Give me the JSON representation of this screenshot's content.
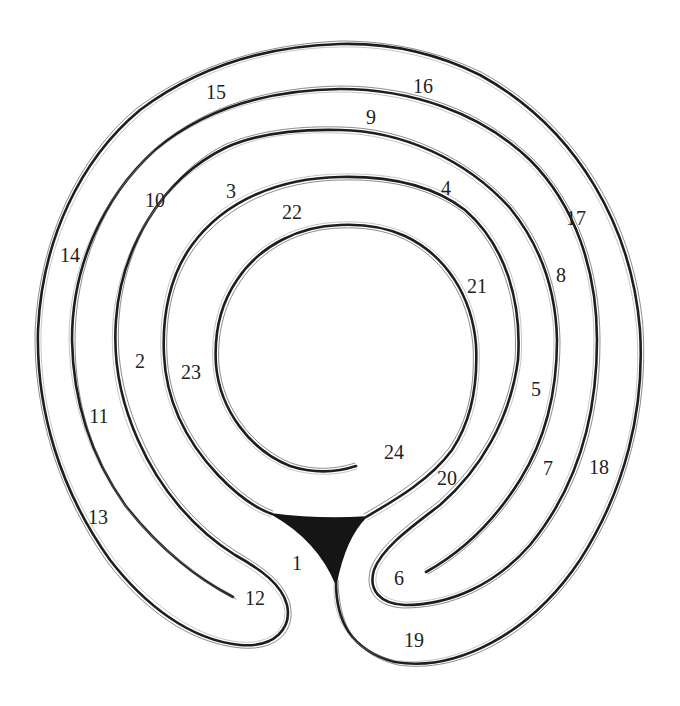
{
  "diagram": {
    "type": "labyrinth",
    "colors": {
      "background": "#ffffff",
      "line": "#1e1e1e",
      "entry_fill": "#151515"
    },
    "entry_marker": "filled-triangle",
    "labels": [
      {
        "id": "1",
        "text": "1",
        "x": 297,
        "y": 563
      },
      {
        "id": "2",
        "text": "2",
        "x": 140,
        "y": 361
      },
      {
        "id": "3",
        "text": "3",
        "x": 231,
        "y": 191
      },
      {
        "id": "4",
        "text": "4",
        "x": 446,
        "y": 188
      },
      {
        "id": "5",
        "text": "5",
        "x": 536,
        "y": 389
      },
      {
        "id": "6",
        "text": "6",
        "x": 399,
        "y": 578
      },
      {
        "id": "7",
        "text": "7",
        "x": 548,
        "y": 468
      },
      {
        "id": "8",
        "text": "8",
        "x": 561,
        "y": 275
      },
      {
        "id": "9",
        "text": "9",
        "x": 371,
        "y": 117
      },
      {
        "id": "10",
        "text": "10",
        "x": 155,
        "y": 200
      },
      {
        "id": "11",
        "text": "11",
        "x": 99,
        "y": 416
      },
      {
        "id": "12",
        "text": "12",
        "x": 255,
        "y": 598
      },
      {
        "id": "13",
        "text": "13",
        "x": 98,
        "y": 517
      },
      {
        "id": "14",
        "text": "14",
        "x": 70,
        "y": 255
      },
      {
        "id": "15",
        "text": "15",
        "x": 216,
        "y": 92
      },
      {
        "id": "16",
        "text": "16",
        "x": 423,
        "y": 86
      },
      {
        "id": "17",
        "text": "17",
        "x": 576,
        "y": 218
      },
      {
        "id": "18",
        "text": "18",
        "x": 599,
        "y": 467
      },
      {
        "id": "19",
        "text": "19",
        "x": 414,
        "y": 640
      },
      {
        "id": "20",
        "text": "20",
        "x": 447,
        "y": 478
      },
      {
        "id": "21",
        "text": "21",
        "x": 477,
        "y": 286
      },
      {
        "id": "22",
        "text": "22",
        "x": 292,
        "y": 212
      },
      {
        "id": "23",
        "text": "23",
        "x": 191,
        "y": 372
      },
      {
        "id": "24",
        "text": "24",
        "x": 394,
        "y": 452
      }
    ]
  }
}
